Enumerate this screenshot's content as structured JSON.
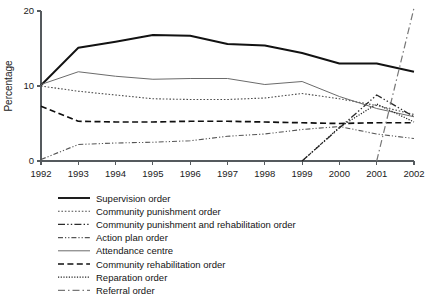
{
  "chart_data": {
    "type": "line",
    "title": "",
    "subtitle": "",
    "xlabel": "",
    "ylabel": "Percentage",
    "x": [
      1992,
      1993,
      1994,
      1995,
      1996,
      1997,
      1998,
      1999,
      2000,
      2001,
      2002
    ],
    "xtick_labels": [
      "1992",
      "1993",
      "1994",
      "1995",
      "1996",
      "1997",
      "1998",
      "1999",
      "2000",
      "2001",
      "2002"
    ],
    "ytick_labels": [
      "0",
      "10",
      "20"
    ],
    "yticks": [
      0,
      10,
      20
    ],
    "ylim": [
      0,
      20
    ],
    "xlim": [
      1992,
      2002
    ],
    "grid": false,
    "legend_position": "below",
    "series": [
      {
        "name": "Supervision order",
        "style": "solid-thick",
        "color": "#121212",
        "values": [
          10.1,
          15.1,
          15.9,
          16.8,
          16.7,
          15.6,
          15.4,
          14.4,
          13.0,
          13.0,
          11.9
        ]
      },
      {
        "name": "Community punishment order",
        "style": "dotted",
        "color": "#4d4d4d",
        "values": [
          10.0,
          9.3,
          8.8,
          8.3,
          8.2,
          8.2,
          8.4,
          9.0,
          8.3,
          7.4,
          6.2
        ]
      },
      {
        "name": "Community punishment and rehabilitation order",
        "style": "dash-dot-dot",
        "color": "#2b2b2b",
        "values": [
          null,
          null,
          null,
          null,
          null,
          null,
          null,
          0.0,
          4.4,
          8.8,
          5.9
        ]
      },
      {
        "name": "Action plan order",
        "style": "dash-dot-dot-fine",
        "color": "#555555",
        "values": [
          0.2,
          2.2,
          2.4,
          2.5,
          2.7,
          3.3,
          3.6,
          4.2,
          4.6,
          3.6,
          3.0
        ]
      },
      {
        "name": "Attendance centre",
        "style": "solid-thin",
        "color": "#6b6b6b",
        "values": [
          10.2,
          11.9,
          11.3,
          10.9,
          11.0,
          11.0,
          10.2,
          10.6,
          8.6,
          7.0,
          5.9
        ]
      },
      {
        "name": "Community rehabilitation order",
        "style": "dashed",
        "color": "#0f0f0f",
        "values": [
          7.3,
          5.3,
          5.2,
          5.2,
          5.3,
          5.3,
          5.2,
          5.1,
          5.0,
          5.1,
          5.1
        ]
      },
      {
        "name": "Reparation order",
        "style": "fine-dotted",
        "color": "#222222",
        "values": [
          null,
          null,
          null,
          null,
          null,
          null,
          null,
          0.0,
          4.5,
          7.6,
          5.2
        ]
      },
      {
        "name": "Referral order",
        "style": "long-dash-dot",
        "color": "#777777",
        "values": [
          null,
          null,
          null,
          null,
          null,
          null,
          null,
          null,
          null,
          0.0,
          20.4
        ]
      }
    ]
  },
  "legend": {
    "items": [
      {
        "label": "Supervision order"
      },
      {
        "label": "Community punishment order"
      },
      {
        "label": "Community punishment and rehabilitation order"
      },
      {
        "label": "Action plan order"
      },
      {
        "label": "Attendance centre"
      },
      {
        "label": "Community rehabilitation order"
      },
      {
        "label": "Reparation order"
      },
      {
        "label": "Referral order"
      }
    ]
  }
}
